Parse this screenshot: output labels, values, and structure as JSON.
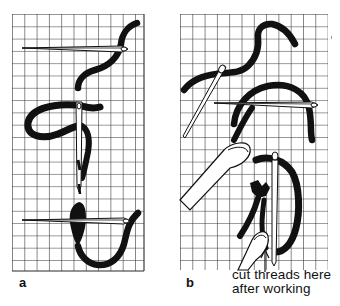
{
  "figure": {
    "panels": [
      {
        "id": "a",
        "label": "a"
      },
      {
        "id": "b",
        "label": "b"
      }
    ],
    "caption_lines": [
      "cut threads here",
      "after working"
    ],
    "colors": {
      "grid": "#2a2a2a",
      "thread": "#111111",
      "needle": "#ffffff",
      "background": "#ffffff"
    }
  }
}
